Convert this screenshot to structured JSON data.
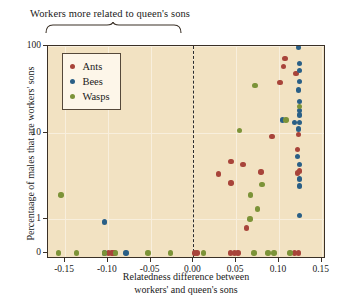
{
  "annotation": {
    "bracket_label": "Workers more related to queen's sons"
  },
  "axes": {
    "ylabel": "Percentaage of males that are workers' sons",
    "xlabel_line1": "Relatedness difference between",
    "xlabel_line2": "workers' and queen's sons",
    "xticks": [
      "-0.15",
      "-0.10",
      "-0.05",
      "0.00",
      "0.05",
      "0.10",
      "0.15"
    ],
    "ytick_labels": [
      "100",
      "10",
      "1",
      "0"
    ]
  },
  "legend": {
    "items": [
      {
        "label": "Ants",
        "color": "#a8443a"
      },
      {
        "label": "Bees",
        "color": "#2a5f86"
      },
      {
        "label": "Wasps",
        "color": "#7c9338"
      }
    ]
  },
  "colors": {
    "plot_background": "#f2e2c2",
    "frame": "#3a3026",
    "gridline": "#f8efdd",
    "divider": "#2b2b2b",
    "ants": "#a8443a",
    "bees": "#2a5f86",
    "wasps": "#7c9338"
  },
  "chart_data": {
    "type": "scatter",
    "title": "",
    "xlabel": "Relatedness difference between workers' and queen's sons",
    "ylabel": "Percentaage of males that are workers' sons",
    "xlim": [
      -0.17,
      0.155
    ],
    "ylim_log": [
      0.55,
      100
    ],
    "yscale": "log-with-zero-break",
    "ytick_values": [
      100,
      10,
      1,
      0
    ],
    "xtick_values": [
      -0.15,
      -0.1,
      -0.05,
      0.0,
      0.05,
      0.1,
      0.15
    ],
    "grid": true,
    "legend_position": "upper-left",
    "annotations": [
      {
        "text": "Workers more related to queen's sons",
        "type": "bracket",
        "x_from": -0.17,
        "x_to": 0.0
      }
    ],
    "reference_lines": [
      {
        "x": 0.0,
        "style": "dashed"
      }
    ],
    "series": [
      {
        "name": "Ants",
        "color": "#a8443a",
        "points": [
          [
            -0.099,
            0
          ],
          [
            -0.095,
            0
          ],
          [
            -0.092,
            0
          ],
          [
            0.001,
            0
          ],
          [
            0.004,
            0
          ],
          [
            0.043,
            0
          ],
          [
            0.048,
            0
          ],
          [
            0.052,
            0
          ],
          [
            0.118,
            0
          ],
          [
            0.123,
            0
          ],
          [
            0.062,
            0.55
          ],
          [
            0.044,
            2.6
          ],
          [
            0.029,
            3.3
          ],
          [
            0.044,
            4.6
          ],
          [
            0.058,
            4.3
          ],
          [
            0.079,
            3.5
          ],
          [
            0.122,
            3.4
          ],
          [
            0.124,
            3.6
          ],
          [
            0.122,
            6.4
          ],
          [
            0.123,
            9.5
          ],
          [
            0.092,
            9.0
          ],
          [
            0.101,
            38
          ],
          [
            0.105,
            58
          ],
          [
            0.107,
            72
          ],
          [
            0.12,
            48
          ]
        ]
      },
      {
        "name": "Bees",
        "color": "#2a5f86",
        "points": [
          [
            -0.104,
            0
          ],
          [
            -0.104,
            0.82
          ],
          [
            -0.079,
            0
          ],
          [
            0.123,
            96
          ],
          [
            0.124,
            63
          ],
          [
            0.124,
            52
          ],
          [
            0.124,
            39
          ],
          [
            0.123,
            31
          ],
          [
            0.124,
            23
          ],
          [
            0.124,
            18
          ],
          [
            0.124,
            16
          ],
          [
            0.124,
            13
          ],
          [
            0.123,
            11
          ],
          [
            0.118,
            13
          ],
          [
            0.104,
            14
          ],
          [
            0.122,
            5.3
          ],
          [
            0.124,
            4.3
          ],
          [
            0.124,
            2.9
          ],
          [
            0.124,
            2.4
          ],
          [
            0.124,
            1.1
          ]
        ]
      },
      {
        "name": "Wasps",
        "color": "#7c9338",
        "points": [
          [
            -0.158,
            0
          ],
          [
            -0.155,
            1.9
          ],
          [
            -0.137,
            0
          ],
          [
            -0.104,
            0
          ],
          [
            -0.091,
            0
          ],
          [
            -0.053,
            0
          ],
          [
            -0.027,
            0
          ],
          [
            0.012,
            0
          ],
          [
            0.071,
            0
          ],
          [
            0.087,
            0
          ],
          [
            0.094,
            0
          ],
          [
            0.113,
            0
          ],
          [
            0.066,
            1.0
          ],
          [
            0.075,
            1.3
          ],
          [
            0.067,
            1.9
          ],
          [
            0.08,
            2.5
          ],
          [
            0.054,
            10.5
          ],
          [
            0.108,
            14
          ],
          [
            0.124,
            20
          ],
          [
            0.072,
            35
          ]
        ]
      }
    ]
  }
}
